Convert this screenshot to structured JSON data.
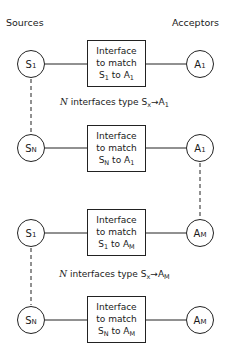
{
  "headers": {
    "left": "Sources",
    "right": "Acceptors"
  },
  "rows": [
    {
      "source": {
        "main": "S",
        "sub": "1"
      },
      "acceptor": {
        "main": "A",
        "sub": "1"
      },
      "box": {
        "line1": "Interface",
        "line2": "to match",
        "s_main": "S",
        "s_sub": "1",
        "to": "to",
        "a_main": "A",
        "a_sub": "1"
      }
    },
    {
      "source": {
        "main": "S",
        "sub": "N"
      },
      "acceptor": {
        "main": "A",
        "sub": "1"
      },
      "box": {
        "line1": "Interface",
        "line2": "to match",
        "s_main": "S",
        "s_sub": "N",
        "to": "to",
        "a_main": "A",
        "a_sub": "1"
      }
    },
    {
      "source": {
        "main": "S",
        "sub": "1"
      },
      "acceptor": {
        "main": "A",
        "sub": "M"
      },
      "box": {
        "line1": "Interface",
        "line2": "to match",
        "s_main": "S",
        "s_sub": "1",
        "to": "to",
        "a_main": "A",
        "a_sub": "M"
      }
    },
    {
      "source": {
        "main": "S",
        "sub": "N"
      },
      "acceptor": {
        "main": "A",
        "sub": "M"
      },
      "box": {
        "line1": "Interface",
        "line2": "to match",
        "s_main": "S",
        "s_sub": "N",
        "to": "to",
        "a_main": "A",
        "a_sub": "M"
      }
    }
  ],
  "group_labels": [
    {
      "count": "N",
      "text": " interfaces type ",
      "s_main": "S",
      "s_sub": "x",
      "arrow": "→",
      "a_main": "A",
      "a_sub": "1"
    },
    {
      "count": "N",
      "text": " interfaces type ",
      "s_main": "S",
      "s_sub": "x",
      "arrow": "→",
      "a_main": "A",
      "a_sub": "M"
    }
  ]
}
